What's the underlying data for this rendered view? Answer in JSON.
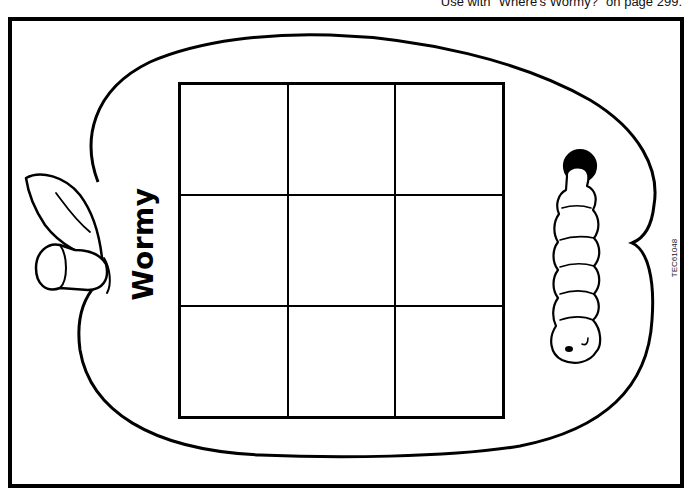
{
  "page": {
    "caption": "Use with \"Where's Wormy?\" on page 299.",
    "product_code": "TEC61048"
  },
  "game_board": {
    "title": "Wormy",
    "shape": "apple",
    "grid": {
      "rows": 3,
      "columns": 3,
      "cells": [
        "",
        "",
        "",
        "",
        "",
        "",
        "",
        "",
        ""
      ]
    },
    "illustrations": [
      "apple-stem-leaf",
      "worm-in-hole"
    ]
  },
  "colors": {
    "ink": "#000000",
    "paper": "#ffffff"
  }
}
